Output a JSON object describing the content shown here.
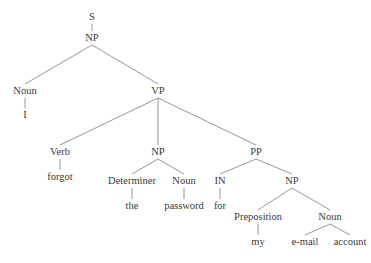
{
  "diagram": {
    "type": "parse-tree",
    "colors": {
      "text": "#3a3a3a",
      "edge": "#8a8a8a",
      "background": "#ffffff"
    },
    "nodes": [
      {
        "id": "n0",
        "label": "S",
        "x": 92,
        "y": 20
      },
      {
        "id": "n1",
        "label": "NP",
        "x": 92,
        "y": 41
      },
      {
        "id": "n2",
        "label": "Noun",
        "x": 25,
        "y": 94
      },
      {
        "id": "n3",
        "label": "I",
        "x": 25,
        "y": 118
      },
      {
        "id": "n4",
        "label": "VP",
        "x": 158,
        "y": 94
      },
      {
        "id": "n5",
        "label": "Verb",
        "x": 60,
        "y": 155
      },
      {
        "id": "n6",
        "label": "forgot",
        "x": 60,
        "y": 180
      },
      {
        "id": "n7",
        "label": "NP",
        "x": 158,
        "y": 155
      },
      {
        "id": "n8",
        "label": "Determiner",
        "x": 132,
        "y": 184
      },
      {
        "id": "n9",
        "label": "the",
        "x": 132,
        "y": 209
      },
      {
        "id": "n10",
        "label": "Noun",
        "x": 184,
        "y": 184
      },
      {
        "id": "n11",
        "label": "password",
        "x": 184,
        "y": 209
      },
      {
        "id": "n12",
        "label": "PP",
        "x": 256,
        "y": 155
      },
      {
        "id": "n13",
        "label": "IN",
        "x": 220,
        "y": 184
      },
      {
        "id": "n14",
        "label": "for",
        "x": 220,
        "y": 209
      },
      {
        "id": "n15",
        "label": "NP",
        "x": 292,
        "y": 184
      },
      {
        "id": "n16",
        "label": "Preposition",
        "x": 258,
        "y": 220
      },
      {
        "id": "n17",
        "label": "my",
        "x": 258,
        "y": 245
      },
      {
        "id": "n18",
        "label": "Noun",
        "x": 330,
        "y": 220
      },
      {
        "id": "n19",
        "label": "e-mail",
        "x": 305,
        "y": 245
      },
      {
        "id": "n20",
        "label": "account",
        "x": 350,
        "y": 245
      }
    ],
    "edges": [
      [
        "n0",
        "n1"
      ],
      [
        "n1",
        "n2"
      ],
      [
        "n2",
        "n3"
      ],
      [
        "n1",
        "n4"
      ],
      [
        "n4",
        "n5"
      ],
      [
        "n5",
        "n6"
      ],
      [
        "n4",
        "n7"
      ],
      [
        "n7",
        "n8"
      ],
      [
        "n8",
        "n9"
      ],
      [
        "n7",
        "n10"
      ],
      [
        "n10",
        "n11"
      ],
      [
        "n4",
        "n12"
      ],
      [
        "n12",
        "n13"
      ],
      [
        "n13",
        "n14"
      ],
      [
        "n12",
        "n15"
      ],
      [
        "n15",
        "n16"
      ],
      [
        "n16",
        "n17"
      ],
      [
        "n15",
        "n18"
      ],
      [
        "n18",
        "n19"
      ],
      [
        "n18",
        "n20"
      ]
    ]
  }
}
